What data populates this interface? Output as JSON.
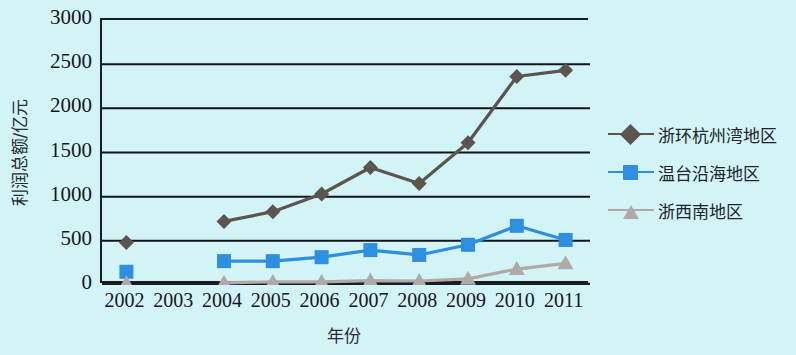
{
  "chart_data": {
    "type": "line",
    "title": "",
    "xlabel": "年份",
    "ylabel": "利润总额/亿元",
    "categories": [
      "2002",
      "2003",
      "2004",
      "2005",
      "2006",
      "2007",
      "2008",
      "2009",
      "2010",
      "2011"
    ],
    "x": [
      2002,
      2003,
      2004,
      2005,
      2006,
      2007,
      2008,
      2009,
      2010,
      2011
    ],
    "ylim": [
      0,
      3000
    ],
    "y_ticks": [
      0,
      500,
      1000,
      1500,
      2000,
      2500,
      3000
    ],
    "y_tick_labels": [
      "0",
      "500",
      "1000",
      "1500",
      "2000",
      "2500",
      "3000"
    ],
    "grid": "horizontal",
    "legend_position": "right",
    "series": [
      {
        "name": "浙环杭州湾地区",
        "color": "#5b5550",
        "marker": "diamond",
        "values": [
          480,
          null,
          720,
          830,
          1030,
          1330,
          1150,
          1610,
          2360,
          2430
        ]
      },
      {
        "name": "温台沿海地区",
        "color": "#2e8fe0",
        "marker": "square",
        "values": [
          150,
          null,
          270,
          270,
          315,
          395,
          340,
          455,
          670,
          510
        ]
      },
      {
        "name": "浙西南地区",
        "color": "#b1a9a7",
        "marker": "triangle",
        "values": [
          20,
          null,
          25,
          35,
          35,
          50,
          45,
          70,
          180,
          245
        ]
      }
    ]
  },
  "figure": {
    "background_color": "#d2f4f6",
    "axis_color": "#1b1b22",
    "gridline_color": "#14141a"
  }
}
